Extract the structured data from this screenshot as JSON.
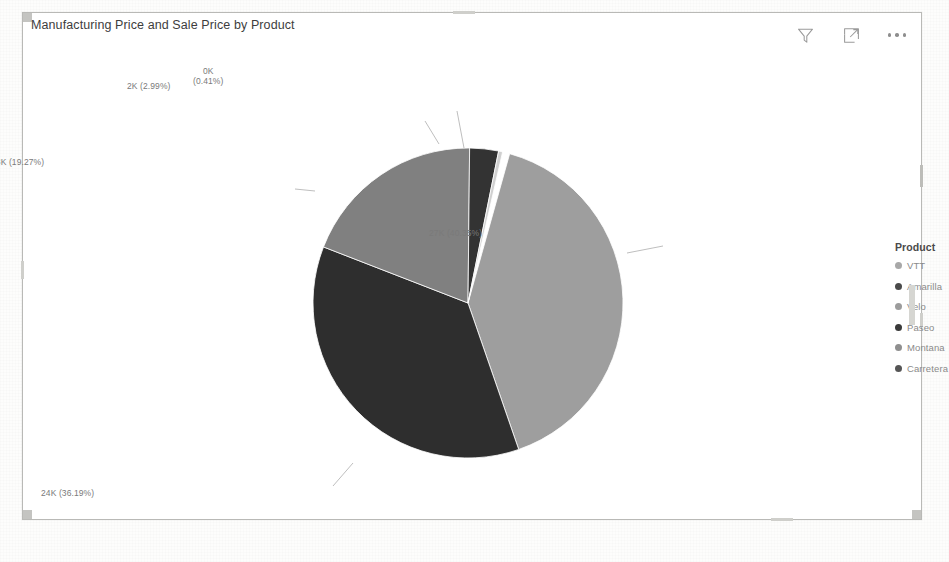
{
  "card": {
    "title": "Manufacturing Price and Sale Price by Product",
    "tools": [
      {
        "name": "filter-icon",
        "label": "Filters"
      },
      {
        "name": "focus-mode-icon",
        "label": "Focus mode"
      },
      {
        "name": "more-options-icon",
        "label": "More options"
      }
    ]
  },
  "legend": {
    "title": "Product",
    "items": [
      {
        "label": "VTT",
        "color": "#a8a8a8"
      },
      {
        "label": "Amarilla",
        "color": "#4a4a4a"
      },
      {
        "label": "Velo",
        "color": "#9c9c9c"
      },
      {
        "label": "Paseo",
        "color": "#3a3a3a"
      },
      {
        "label": "Montana",
        "color": "#8f8f8f"
      },
      {
        "label": "Carretera",
        "color": "#555555"
      }
    ]
  },
  "chart_data": {
    "type": "pie",
    "title": "Manufacturing Price and Sale Price by Product",
    "legend_title": "Product",
    "legend_position": "right",
    "labels": [
      "VTT",
      "Amarilla",
      "Velo",
      "Paseo",
      "Montana",
      "Carretera"
    ],
    "categories": [
      "Paseo",
      "Velo",
      "VTT",
      "Amarilla",
      "Montana",
      "Carretera"
    ],
    "slices": [
      {
        "label_text": "27K (40.35%)",
        "value_display": "27K",
        "value": 27000,
        "percent": 40.35,
        "color": "#9e9e9e",
        "start_angle": 15.6,
        "end_angle": 160.9
      },
      {
        "label_text": "24K (36.19%)",
        "value_display": "24K",
        "value": 24000,
        "percent": 36.19,
        "color": "#2e2e2e",
        "start_angle": 160.9,
        "end_angle": 291.2
      },
      {
        "label_text": "13K (19.27%)",
        "value_display": "13K",
        "value": 13000,
        "percent": 19.27,
        "color": "#808080",
        "start_angle": 291.2,
        "end_angle": 360.6
      },
      {
        "label_text": "2K (2.99%)",
        "value_display": "2K",
        "value": 2000,
        "percent": 2.99,
        "color": "#333333",
        "start_angle": 360.6,
        "end_angle": 371.4
      },
      {
        "label_text": "0K (0.41%)",
        "value_display": "0K",
        "value": 0,
        "percent": 0.41,
        "color": "#d0d0d0",
        "start_angle": 371.4,
        "end_angle": 372.9
      }
    ],
    "label_format": "value (percent)",
    "total_percent": 99.21
  }
}
